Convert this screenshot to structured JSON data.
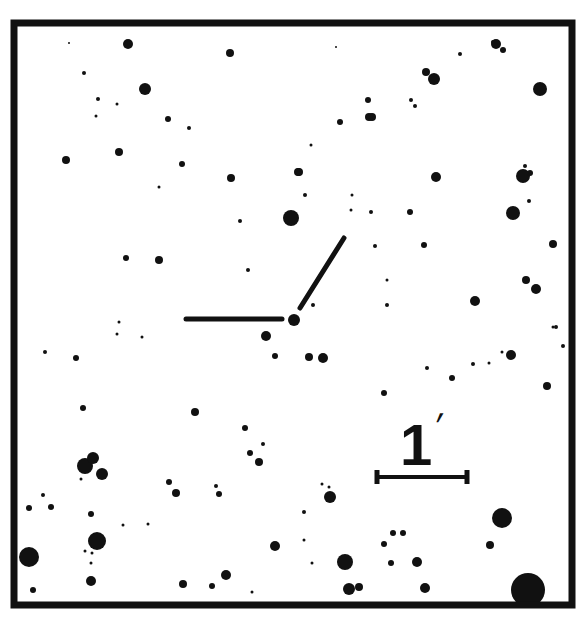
{
  "frame": {
    "x": 14,
    "y": 23,
    "width": 558,
    "height": 582,
    "stroke": 7,
    "color": "#111111"
  },
  "scale_bar": {
    "label": "1",
    "unit_symbol": "′",
    "x1": 377,
    "x2": 467,
    "y": 477
  },
  "target_marker": {
    "target": {
      "x": 294,
      "y": 320,
      "r": 6
    },
    "horizontal_line": {
      "x1": 186,
      "y1": 319,
      "x2": 282,
      "y2": 319
    },
    "diagonal_line": {
      "x1": 300,
      "y1": 308,
      "x2": 344,
      "y2": 238
    }
  },
  "stars": [
    [
      69,
      43,
      1
    ],
    [
      128,
      44,
      5
    ],
    [
      230,
      53,
      4
    ],
    [
      84,
      73,
      2
    ],
    [
      145,
      89,
      6
    ],
    [
      98,
      99,
      2
    ],
    [
      117,
      104,
      1.5
    ],
    [
      96,
      116,
      1.5
    ],
    [
      168,
      119,
      3
    ],
    [
      189,
      128,
      2
    ],
    [
      66,
      160,
      4
    ],
    [
      119,
      152,
      4
    ],
    [
      182,
      164,
      3
    ],
    [
      159,
      187,
      1.5
    ],
    [
      231,
      178,
      4
    ],
    [
      298,
      172,
      4
    ],
    [
      291,
      218,
      8
    ],
    [
      240,
      221,
      2
    ],
    [
      248,
      270,
      2
    ],
    [
      126,
      258,
      3
    ],
    [
      159,
      260,
      4
    ],
    [
      336,
      47,
      1
    ],
    [
      460,
      54,
      2
    ],
    [
      426,
      72,
      4
    ],
    [
      434,
      79,
      6
    ],
    [
      368,
      100,
      3
    ],
    [
      411,
      100,
      2
    ],
    [
      415,
      106,
      2
    ],
    [
      369,
      117,
      4
    ],
    [
      372,
      117,
      4
    ],
    [
      540,
      89,
      7
    ],
    [
      340,
      122,
      3
    ],
    [
      496,
      44,
      5
    ],
    [
      503,
      50,
      3
    ],
    [
      311,
      145,
      1.5
    ],
    [
      299,
      172,
      4
    ],
    [
      305,
      195,
      2
    ],
    [
      352,
      195,
      1.5
    ],
    [
      351,
      210,
      1.5
    ],
    [
      371,
      212,
      2
    ],
    [
      410,
      212,
      3
    ],
    [
      436,
      177,
      5
    ],
    [
      523,
      176,
      7
    ],
    [
      525,
      166,
      2
    ],
    [
      530,
      173,
      3
    ],
    [
      529,
      201,
      2
    ],
    [
      513,
      213,
      7
    ],
    [
      375,
      246,
      2
    ],
    [
      424,
      245,
      3
    ],
    [
      553,
      244,
      4
    ],
    [
      526,
      280,
      4
    ],
    [
      536,
      289,
      5
    ],
    [
      475,
      301,
      5
    ],
    [
      387,
      280,
      1.5
    ],
    [
      387,
      305,
      2
    ],
    [
      313,
      305,
      2
    ],
    [
      266,
      336,
      5
    ],
    [
      309,
      357,
      4
    ],
    [
      323,
      358,
      5
    ],
    [
      275,
      356,
      3
    ],
    [
      384,
      393,
      3
    ],
    [
      427,
      368,
      2
    ],
    [
      452,
      378,
      3
    ],
    [
      473,
      364,
      2
    ],
    [
      511,
      355,
      5
    ],
    [
      502,
      352,
      1.5
    ],
    [
      489,
      363,
      1.5
    ],
    [
      547,
      386,
      4
    ],
    [
      556,
      327,
      2
    ],
    [
      563,
      346,
      2
    ],
    [
      45,
      352,
      2
    ],
    [
      76,
      358,
      3
    ],
    [
      119,
      322,
      1.5
    ],
    [
      117,
      334,
      1.5
    ],
    [
      142,
      337,
      1.5
    ],
    [
      195,
      412,
      4
    ],
    [
      245,
      428,
      3
    ],
    [
      263,
      444,
      2
    ],
    [
      250,
      453,
      3
    ],
    [
      259,
      462,
      4
    ],
    [
      83,
      408,
      3
    ],
    [
      85,
      466,
      8
    ],
    [
      93,
      458,
      6
    ],
    [
      102,
      474,
      6
    ],
    [
      81,
      479,
      1.5
    ],
    [
      43,
      495,
      2
    ],
    [
      29,
      508,
      3
    ],
    [
      51,
      507,
      3
    ],
    [
      91,
      514,
      3
    ],
    [
      97,
      541,
      9
    ],
    [
      85,
      551,
      1.5
    ],
    [
      92,
      553,
      1.5
    ],
    [
      91,
      563,
      1.5
    ],
    [
      29,
      557,
      10
    ],
    [
      33,
      590,
      3
    ],
    [
      91,
      581,
      5
    ],
    [
      169,
      482,
      3
    ],
    [
      176,
      493,
      4
    ],
    [
      216,
      486,
      2
    ],
    [
      219,
      494,
      3
    ],
    [
      275,
      546,
      5
    ],
    [
      123,
      525,
      1.5
    ],
    [
      148,
      524,
      1.5
    ],
    [
      183,
      584,
      4
    ],
    [
      212,
      586,
      3
    ],
    [
      226,
      575,
      5
    ],
    [
      252,
      592,
      1.5
    ],
    [
      330,
      497,
      6
    ],
    [
      322,
      484,
      1.5
    ],
    [
      329,
      487,
      1.5
    ],
    [
      304,
      512,
      2
    ],
    [
      304,
      540,
      1.5
    ],
    [
      393,
      533,
      3
    ],
    [
      403,
      533,
      3
    ],
    [
      384,
      544,
      3
    ],
    [
      391,
      563,
      3
    ],
    [
      417,
      562,
      5
    ],
    [
      345,
      562,
      8
    ],
    [
      349,
      589,
      6
    ],
    [
      359,
      587,
      4
    ],
    [
      425,
      588,
      5
    ],
    [
      502,
      518,
      10
    ],
    [
      490,
      545,
      4
    ],
    [
      528,
      590,
      17
    ],
    [
      493,
      42,
      2
    ],
    [
      553,
      327,
      1.5
    ],
    [
      312,
      563,
      1.5
    ]
  ],
  "colors": {
    "ink": "#111111",
    "background": "#ffffff"
  }
}
